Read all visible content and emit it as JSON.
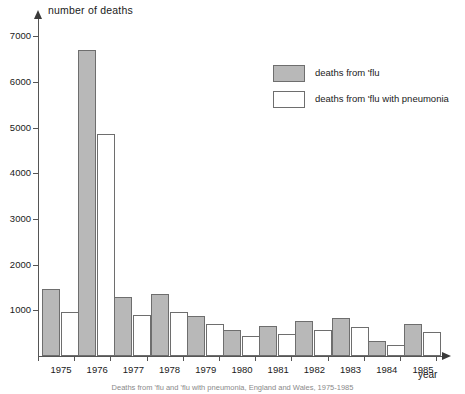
{
  "chart_data": {
    "type": "bar",
    "title": "",
    "ylabel": "number of deaths",
    "xlabel": "year",
    "categories": [
      "1975",
      "1976",
      "1977",
      "1978",
      "1979",
      "1980",
      "1981",
      "1982",
      "1983",
      "1984",
      "1985"
    ],
    "series": [
      {
        "name": "deaths from 'flu",
        "color": "#b8b8b8",
        "values": [
          1460,
          6700,
          1300,
          1350,
          880,
          570,
          650,
          760,
          840,
          330,
          700
        ]
      },
      {
        "name": "deaths from 'flu with pneumonia",
        "color": "#ffffff",
        "values": [
          960,
          4870,
          900,
          960,
          690,
          430,
          480,
          560,
          630,
          240,
          520
        ]
      }
    ],
    "ylim": [
      0,
      7400
    ],
    "yticks": [
      1000,
      2000,
      3000,
      4000,
      5000,
      6000,
      7000
    ],
    "ytick_labels": [
      "1000",
      "2000",
      "3000",
      "4000",
      "5000",
      "6000",
      "7000"
    ],
    "grid": false,
    "legend_position": "upper-right"
  },
  "axes": {
    "y_title": "number of deaths",
    "x_title": "year"
  },
  "legend": {
    "items": [
      {
        "label": "deaths from 'flu",
        "swatch": "grey"
      },
      {
        "label": "deaths from 'flu with pneumonia",
        "swatch": "white"
      }
    ]
  },
  "caption": {
    "text": "Deaths from 'flu and 'flu with pneumonia, England and Wales, 1975-1985"
  }
}
